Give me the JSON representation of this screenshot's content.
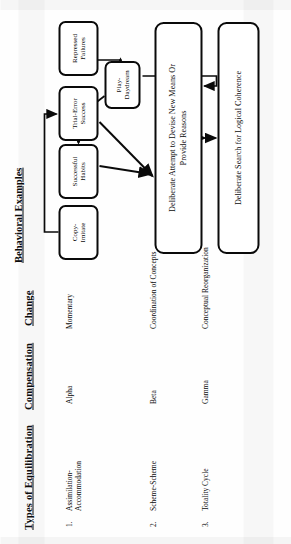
{
  "document": {
    "orientation": "rotated-90-ccw",
    "ink_color": "#0b0b0b",
    "paper_color": "#fefefe"
  },
  "table": {
    "headers": {
      "types": "Types of Equilibration",
      "compensation": "Compensation",
      "change": "Change"
    },
    "rows": [
      {
        "number": "1.",
        "types": "Assimilation-\nAccommodation",
        "compensation": "Alpha",
        "change": "Momentary"
      },
      {
        "number": "2.",
        "types": "Scheme-Scheme",
        "compensation": "Beta",
        "change": "Coordination of Concepts"
      },
      {
        "number": "3.",
        "types": "Totality Cycle",
        "compensation": "Gamma",
        "change": "Conceptual Reorganization"
      }
    ]
  },
  "chart": {
    "title": "Behavioral Examples",
    "nodes": {
      "copy_imitate": "Copy-\nImitate",
      "successful_habits": "Successful\nHabits",
      "trial_error": "Trial-Error\nSuccess",
      "play_daydream": "Play-Daydream",
      "repressed_failures": "Repressed\nFailures",
      "devise_new_means": "Deliberate Attempt to Devise New Means Or\nProvide Reasons",
      "logical_coherence": "Deliberate Search for Logical Coherence"
    }
  }
}
